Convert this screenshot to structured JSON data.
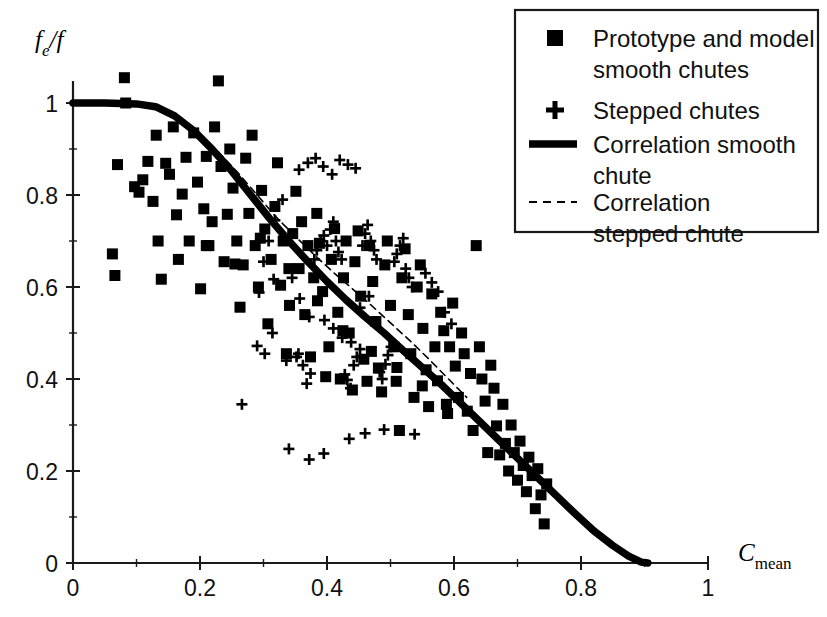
{
  "chart_data": {
    "type": "scatter",
    "title": "",
    "xlabel": "C_mean",
    "xlabel_base": "C",
    "xlabel_sub": "mean",
    "ylabel": "f_e/f",
    "ylabel_base": "f",
    "ylabel_sub": "e",
    "ylabel_tail": "/f",
    "xlim": [
      0,
      1
    ],
    "ylim": [
      0,
      1
    ],
    "xticks": [
      0,
      0.2,
      0.4,
      0.6,
      0.8,
      1
    ],
    "xtick_labels": [
      "0",
      "0.2",
      "0.4",
      "0.6",
      "0.8",
      "1"
    ],
    "yticks": [
      0,
      0.2,
      0.4,
      0.6,
      0.8,
      1
    ],
    "ytick_labels": [
      "0",
      "0.2",
      "0.4",
      "0.6",
      "0.8",
      "1"
    ],
    "x_minor_ticks": [
      0.1,
      0.3,
      0.5,
      0.7,
      0.9
    ],
    "y_minor_ticks": [
      0.1,
      0.3,
      0.5,
      0.7,
      0.9
    ],
    "grid": false,
    "legend_position": "top-right",
    "series": [
      {
        "name": "Prototype and model smooth chutes",
        "marker": "square",
        "color": "#000000",
        "points": [
          [
            0.062,
            0.672
          ],
          [
            0.066,
            0.625
          ],
          [
            0.07,
            0.866
          ],
          [
            0.081,
            1.055
          ],
          [
            0.083,
            1.0
          ],
          [
            0.097,
            0.818
          ],
          [
            0.104,
            0.806
          ],
          [
            0.11,
            0.833
          ],
          [
            0.118,
            0.873
          ],
          [
            0.126,
            0.786
          ],
          [
            0.131,
            0.93
          ],
          [
            0.134,
            0.7
          ],
          [
            0.139,
            0.617
          ],
          [
            0.146,
            0.869
          ],
          [
            0.152,
            0.845
          ],
          [
            0.158,
            0.948
          ],
          [
            0.163,
            0.757
          ],
          [
            0.166,
            0.66
          ],
          [
            0.172,
            0.802
          ],
          [
            0.178,
            0.882
          ],
          [
            0.183,
            0.7
          ],
          [
            0.19,
            0.935
          ],
          [
            0.196,
            0.828
          ],
          [
            0.201,
            0.596
          ],
          [
            0.206,
            0.77
          ],
          [
            0.21,
            0.884
          ],
          [
            0.214,
            0.69
          ],
          [
            0.219,
            0.742
          ],
          [
            0.223,
            0.948
          ],
          [
            0.229,
            1.048
          ],
          [
            0.233,
            0.862
          ],
          [
            0.238,
            0.655
          ],
          [
            0.243,
            0.758
          ],
          [
            0.247,
            0.9
          ],
          [
            0.252,
            0.815
          ],
          [
            0.258,
            0.7
          ],
          [
            0.263,
            0.556
          ],
          [
            0.268,
            0.648
          ],
          [
            0.272,
            0.88
          ],
          [
            0.277,
            0.76
          ],
          [
            0.282,
            0.93
          ],
          [
            0.287,
            0.69
          ],
          [
            0.292,
            0.6
          ],
          [
            0.297,
            0.81
          ],
          [
            0.302,
            0.726
          ],
          [
            0.307,
            0.52
          ],
          [
            0.312,
            0.66
          ],
          [
            0.318,
            0.775
          ],
          [
            0.322,
            0.87
          ],
          [
            0.327,
            0.604
          ],
          [
            0.331,
            0.7
          ],
          [
            0.336,
            0.455
          ],
          [
            0.341,
            0.56
          ],
          [
            0.346,
            0.716
          ],
          [
            0.351,
            0.808
          ],
          [
            0.356,
            0.64
          ],
          [
            0.36,
            0.742
          ],
          [
            0.365,
            0.54
          ],
          [
            0.37,
            0.69
          ],
          [
            0.374,
            0.448
          ],
          [
            0.379,
            0.62
          ],
          [
            0.384,
            0.76
          ],
          [
            0.388,
            0.695
          ],
          [
            0.393,
            0.59
          ],
          [
            0.398,
            0.405
          ],
          [
            0.403,
            0.47
          ],
          [
            0.407,
            0.66
          ],
          [
            0.412,
            0.727
          ],
          [
            0.417,
            0.545
          ],
          [
            0.421,
            0.4
          ],
          [
            0.426,
            0.62
          ],
          [
            0.43,
            0.7
          ],
          [
            0.435,
            0.5
          ],
          [
            0.44,
            0.376
          ],
          [
            0.444,
            0.655
          ],
          [
            0.449,
            0.722
          ],
          [
            0.453,
            0.58
          ],
          [
            0.458,
            0.443
          ],
          [
            0.463,
            0.395
          ],
          [
            0.467,
            0.69
          ],
          [
            0.472,
            0.612
          ],
          [
            0.477,
            0.525
          ],
          [
            0.481,
            0.424
          ],
          [
            0.486,
            0.372
          ],
          [
            0.491,
            0.648
          ],
          [
            0.495,
            0.7
          ],
          [
            0.5,
            0.56
          ],
          [
            0.505,
            0.47
          ],
          [
            0.509,
            0.395
          ],
          [
            0.514,
            0.288
          ],
          [
            0.518,
            0.62
          ],
          [
            0.523,
            0.683
          ],
          [
            0.528,
            0.54
          ],
          [
            0.532,
            0.455
          ],
          [
            0.537,
            0.36
          ],
          [
            0.542,
            0.6
          ],
          [
            0.547,
            0.648
          ],
          [
            0.551,
            0.51
          ],
          [
            0.556,
            0.42
          ],
          [
            0.56,
            0.34
          ],
          [
            0.565,
            0.585
          ],
          [
            0.57,
            0.47
          ],
          [
            0.574,
            0.396
          ],
          [
            0.579,
            0.545
          ],
          [
            0.584,
            0.505
          ],
          [
            0.588,
            0.345
          ],
          [
            0.593,
            0.47
          ],
          [
            0.598,
            0.565
          ],
          [
            0.602,
            0.428
          ],
          [
            0.607,
            0.36
          ],
          [
            0.612,
            0.5
          ],
          [
            0.616,
            0.455
          ],
          [
            0.621,
            0.33
          ],
          [
            0.626,
            0.412
          ],
          [
            0.63,
            0.288
          ],
          [
            0.635,
            0.69
          ],
          [
            0.64,
            0.47
          ],
          [
            0.644,
            0.4
          ],
          [
            0.649,
            0.352
          ],
          [
            0.653,
            0.24
          ],
          [
            0.658,
            0.43
          ],
          [
            0.663,
            0.38
          ],
          [
            0.667,
            0.298
          ],
          [
            0.672,
            0.235
          ],
          [
            0.677,
            0.345
          ],
          [
            0.681,
            0.26
          ],
          [
            0.686,
            0.2
          ],
          [
            0.69,
            0.3
          ],
          [
            0.695,
            0.24
          ],
          [
            0.7,
            0.18
          ],
          [
            0.704,
            0.265
          ],
          [
            0.709,
            0.212
          ],
          [
            0.714,
            0.155
          ],
          [
            0.718,
            0.23
          ],
          [
            0.723,
            0.19
          ],
          [
            0.728,
            0.118
          ],
          [
            0.732,
            0.205
          ],
          [
            0.737,
            0.148
          ],
          [
            0.742,
            0.085
          ],
          [
            0.746,
            0.172
          ],
          [
            0.21,
            0.69
          ],
          [
            0.255,
            0.65
          ],
          [
            0.295,
            0.706
          ],
          [
            0.34,
            0.64
          ],
          [
            0.385,
            0.57
          ],
          [
            0.425,
            0.505
          ],
          [
            0.47,
            0.46
          ],
          [
            0.51,
            0.425
          ],
          [
            0.55,
            0.385
          ],
          [
            0.59,
            0.325
          ]
        ]
      },
      {
        "name": "Stepped chutes",
        "marker": "plus",
        "color": "#000000",
        "points": [
          [
            0.266,
            0.345
          ],
          [
            0.293,
            0.588
          ],
          [
            0.316,
            0.617
          ],
          [
            0.336,
            0.44
          ],
          [
            0.352,
            0.448
          ],
          [
            0.355,
            0.455
          ],
          [
            0.362,
            0.43
          ],
          [
            0.368,
            0.39
          ],
          [
            0.374,
            0.412
          ],
          [
            0.38,
            0.66
          ],
          [
            0.384,
            0.68
          ],
          [
            0.39,
            0.7
          ],
          [
            0.395,
            0.712
          ],
          [
            0.4,
            0.69
          ],
          [
            0.405,
            0.725
          ],
          [
            0.41,
            0.742
          ],
          [
            0.414,
            0.7
          ],
          [
            0.418,
            0.676
          ],
          [
            0.423,
            0.66
          ],
          [
            0.428,
            0.41
          ],
          [
            0.432,
            0.398
          ],
          [
            0.437,
            0.38
          ],
          [
            0.442,
            0.43
          ],
          [
            0.447,
            0.448
          ],
          [
            0.452,
            0.465
          ],
          [
            0.456,
            0.69
          ],
          [
            0.46,
            0.716
          ],
          [
            0.464,
            0.735
          ],
          [
            0.469,
            0.7
          ],
          [
            0.474,
            0.68
          ],
          [
            0.478,
            0.66
          ],
          [
            0.483,
            0.415
          ],
          [
            0.487,
            0.4
          ],
          [
            0.492,
            0.432
          ],
          [
            0.496,
            0.452
          ],
          [
            0.501,
            0.47
          ],
          [
            0.506,
            0.655
          ],
          [
            0.51,
            0.672
          ],
          [
            0.515,
            0.69
          ],
          [
            0.52,
            0.706
          ],
          [
            0.524,
            0.64
          ],
          [
            0.529,
            0.62
          ],
          [
            0.534,
            0.6
          ],
          [
            0.538,
            0.28
          ],
          [
            0.46,
            0.282
          ],
          [
            0.49,
            0.29
          ],
          [
            0.435,
            0.27
          ],
          [
            0.356,
            0.855
          ],
          [
            0.37,
            0.87
          ],
          [
            0.382,
            0.88
          ],
          [
            0.394,
            0.862
          ],
          [
            0.408,
            0.845
          ],
          [
            0.42,
            0.876
          ],
          [
            0.433,
            0.866
          ],
          [
            0.445,
            0.858
          ],
          [
            0.33,
            0.79
          ],
          [
            0.318,
            0.745
          ],
          [
            0.308,
            0.7
          ],
          [
            0.3,
            0.655
          ],
          [
            0.345,
            0.62
          ],
          [
            0.357,
            0.575
          ],
          [
            0.372,
            0.535
          ],
          [
            0.396,
            0.528
          ],
          [
            0.41,
            0.51
          ],
          [
            0.424,
            0.49
          ],
          [
            0.438,
            0.48
          ],
          [
            0.452,
            0.555
          ],
          [
            0.466,
            0.58
          ],
          [
            0.29,
            0.472
          ],
          [
            0.302,
            0.455
          ],
          [
            0.314,
            0.5
          ],
          [
            0.555,
            0.63
          ],
          [
            0.565,
            0.61
          ],
          [
            0.575,
            0.59
          ],
          [
            0.585,
            0.545
          ],
          [
            0.596,
            0.52
          ],
          [
            0.34,
            0.248
          ],
          [
            0.395,
            0.238
          ],
          [
            0.372,
            0.225
          ]
        ]
      }
    ],
    "curves": [
      {
        "name": "Correlation smooth chute",
        "style": "solid-thick",
        "color": "#000000",
        "points": [
          [
            0.0,
            1.0
          ],
          [
            0.05,
            1.0
          ],
          [
            0.1,
            0.998
          ],
          [
            0.13,
            0.992
          ],
          [
            0.16,
            0.972
          ],
          [
            0.19,
            0.94
          ],
          [
            0.22,
            0.898
          ],
          [
            0.25,
            0.852
          ],
          [
            0.28,
            0.8
          ],
          [
            0.31,
            0.748
          ],
          [
            0.34,
            0.7
          ],
          [
            0.37,
            0.655
          ],
          [
            0.4,
            0.612
          ],
          [
            0.43,
            0.572
          ],
          [
            0.46,
            0.535
          ],
          [
            0.49,
            0.5
          ],
          [
            0.52,
            0.462
          ],
          [
            0.55,
            0.425
          ],
          [
            0.58,
            0.388
          ],
          [
            0.61,
            0.348
          ],
          [
            0.64,
            0.308
          ],
          [
            0.67,
            0.268
          ],
          [
            0.7,
            0.228
          ],
          [
            0.73,
            0.188
          ],
          [
            0.76,
            0.148
          ],
          [
            0.79,
            0.108
          ],
          [
            0.82,
            0.07
          ],
          [
            0.85,
            0.038
          ],
          [
            0.875,
            0.015
          ],
          [
            0.895,
            0.002
          ],
          [
            0.905,
            0.0
          ]
        ]
      },
      {
        "name": "Correlation stepped chute",
        "style": "dashed-thin",
        "color": "#000000",
        "points": [
          [
            0.14,
            0.99
          ],
          [
            0.17,
            0.968
          ],
          [
            0.2,
            0.932
          ],
          [
            0.23,
            0.892
          ],
          [
            0.26,
            0.848
          ],
          [
            0.29,
            0.8
          ],
          [
            0.32,
            0.752
          ],
          [
            0.35,
            0.71
          ],
          [
            0.38,
            0.67
          ],
          [
            0.41,
            0.632
          ],
          [
            0.44,
            0.596
          ],
          [
            0.47,
            0.56
          ],
          [
            0.5,
            0.522
          ],
          [
            0.53,
            0.484
          ],
          [
            0.56,
            0.444
          ],
          [
            0.59,
            0.402
          ],
          [
            0.62,
            0.36
          ]
        ]
      }
    ]
  },
  "legend": {
    "items": [
      {
        "marker": "square",
        "label_line1": "Prototype and model",
        "label_line2": "smooth chutes"
      },
      {
        "marker": "plus",
        "label_line1": "Stepped chutes",
        "label_line2": ""
      },
      {
        "marker": "solid-line",
        "label_line1": "Correlation smooth",
        "label_line2": "chute"
      },
      {
        "marker": "dashed-line",
        "label_line1": "Correlation",
        "label_line2": "stepped chute"
      }
    ]
  },
  "style": {
    "axis_color": "#1a1a1a",
    "marker_color": "#000000",
    "background": "#ffffff"
  }
}
